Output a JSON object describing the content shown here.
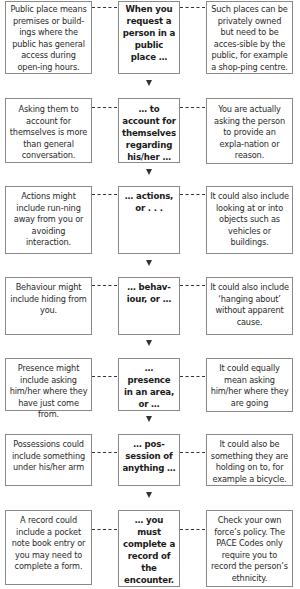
{
  "diagram": {
    "type": "flowchart",
    "rows": [
      {
        "left": "Public place means premises or build-ings where the public has general access during open-ing hours.",
        "center": "When you request a person in a public place …",
        "right": "Such places can be privately owned but need to be acces-sible by the public, for example a shop-ping centre."
      },
      {
        "left": "Asking them to account for themselves is more than general conversation.",
        "center": "… to account for themselves regarding his/her …",
        "right": "You are actually asking the person to provide an expla-nation or reason."
      },
      {
        "left": "Actions might include run-ning away from you or avoiding interaction.",
        "center": "… actions, or . . .",
        "right": "It could also include looking at or into objects such as vehicles or buildings."
      },
      {
        "left": "Behaviour might include hiding from you.",
        "center": "… behav-iour, or …",
        "right": "It could also include ‘hanging about’ without apparent cause."
      },
      {
        "left": "Presence might include asking him/her where they have just come from.",
        "center": "… presence in an area, or …",
        "right": "It could equally mean asking him/her where they are going"
      },
      {
        "left": "Possessions could include something under his/her arm",
        "center": "… pos-session of anything …",
        "right": "It could also be something they are holding on to, for example a bicycle."
      },
      {
        "left": "A record could include a pocket note book entry or you may need to complete a form.",
        "center": "… you must complete a record of the encounter.",
        "right": "Check your own force’s policy.  The PACE Codes only require you to record the person’s ethnicity."
      }
    ]
  },
  "colors": {
    "border": "#8a8a8a",
    "text": "#2a2a2a",
    "connector": "#333333"
  }
}
